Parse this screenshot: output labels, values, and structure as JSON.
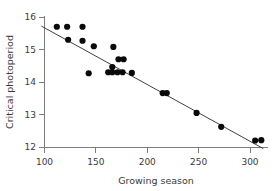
{
  "chart_data": {
    "type": "scatter",
    "title": "",
    "xlabel": "Growing season",
    "ylabel": "Critical photoperiod",
    "xlim": [
      94,
      318
    ],
    "ylim": [
      11.88,
      16.05
    ],
    "xticks": [
      100,
      150,
      200,
      250,
      300
    ],
    "yticks": [
      12,
      13,
      14,
      15,
      16
    ],
    "xtick_labels": [
      "100",
      "150",
      "200",
      "250",
      "300"
    ],
    "ytick_labels": [
      "12",
      "13",
      "14",
      "15",
      "16"
    ],
    "grid": false,
    "legend": null,
    "series": [
      {
        "name": "Populations",
        "marker": "filled-circle",
        "color": "#0a0a0a",
        "points": [
          {
            "x": 112,
            "y": 15.7
          },
          {
            "x": 122,
            "y": 15.7
          },
          {
            "x": 137,
            "y": 15.7
          },
          {
            "x": 123,
            "y": 15.3
          },
          {
            "x": 137,
            "y": 15.27
          },
          {
            "x": 148,
            "y": 15.1
          },
          {
            "x": 143,
            "y": 14.27
          },
          {
            "x": 167,
            "y": 15.08
          },
          {
            "x": 172,
            "y": 14.7
          },
          {
            "x": 177,
            "y": 14.7
          },
          {
            "x": 166,
            "y": 14.46
          },
          {
            "x": 162,
            "y": 14.3
          },
          {
            "x": 166,
            "y": 14.3
          },
          {
            "x": 171,
            "y": 14.3
          },
          {
            "x": 176,
            "y": 14.3
          },
          {
            "x": 185,
            "y": 14.28
          },
          {
            "x": 215,
            "y": 13.66
          },
          {
            "x": 219,
            "y": 13.66
          },
          {
            "x": 248,
            "y": 13.05
          },
          {
            "x": 272,
            "y": 12.62
          },
          {
            "x": 305,
            "y": 12.2
          },
          {
            "x": 311,
            "y": 12.21
          }
        ]
      }
    ],
    "fit_line": {
      "name": "least-squares regression",
      "color": "#2a2a2a",
      "x_start": 97,
      "y_start": 15.72,
      "x_end": 313,
      "y_end": 11.95
    }
  }
}
